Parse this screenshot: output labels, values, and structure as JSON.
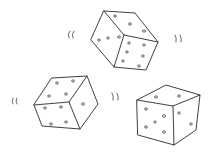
{
  "scene": {
    "description": "Hand-drawn sketch of three dice with motion marks",
    "background": "#ffffff",
    "ink_color": "#2a2a2a",
    "dice": [
      {
        "name": "top-die",
        "visible_faces": [
          {
            "face": "top",
            "pips": 3
          },
          {
            "face": "left",
            "pips": 3
          },
          {
            "face": "right",
            "pips": 6
          }
        ]
      },
      {
        "name": "bottom-left-die",
        "visible_faces": [
          {
            "face": "top",
            "pips": 4
          },
          {
            "face": "front",
            "pips": 4
          },
          {
            "face": "right",
            "pips": 1
          }
        ]
      },
      {
        "name": "bottom-right-die",
        "visible_faces": [
          {
            "face": "top",
            "pips": 2
          },
          {
            "face": "front",
            "pips": 5
          },
          {
            "face": "right",
            "pips": 2
          }
        ]
      }
    ],
    "motion_marks": [
      {
        "name": "motion-mark-top-left",
        "glyph": "(("
      },
      {
        "name": "motion-mark-top-right",
        "glyph": "))"
      },
      {
        "name": "motion-mark-middle-left",
        "glyph": "(("
      },
      {
        "name": "motion-mark-middle-right",
        "glyph": "))"
      }
    ]
  }
}
